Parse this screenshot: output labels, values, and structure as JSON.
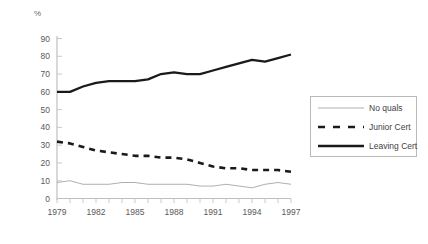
{
  "chart_data": {
    "type": "line",
    "title": "",
    "xlabel": "",
    "ylabel": "%",
    "unit_label": "%",
    "xlim": [
      1979,
      1997
    ],
    "ylim": [
      0,
      90
    ],
    "y_ticks": [
      0,
      10,
      20,
      30,
      40,
      50,
      60,
      70,
      80,
      90
    ],
    "y_tick_labels": [
      "0",
      "10",
      "20",
      "30",
      "40",
      "50",
      "60",
      "70",
      "80",
      "90"
    ],
    "x": [
      1979,
      1980,
      1981,
      1982,
      1983,
      1984,
      1985,
      1986,
      1987,
      1988,
      1989,
      1990,
      1991,
      1992,
      1993,
      1994,
      1995,
      1996,
      1997
    ],
    "x_tick_labels": [
      "1979",
      "1982",
      "1985",
      "1988",
      "1991",
      "1994",
      "1997"
    ],
    "x_ticks": [
      1979,
      1982,
      1985,
      1988,
      1991,
      1994,
      1997
    ],
    "grid": false,
    "legend_position": "right",
    "series": [
      {
        "name": "No quals",
        "style": "thin-solid",
        "color": "#a6a6a6",
        "values": [
          9,
          10,
          8,
          8,
          8,
          9,
          9,
          8,
          8,
          8,
          8,
          7,
          7,
          8,
          7,
          6,
          8,
          9,
          8
        ]
      },
      {
        "name": "Junior Cert",
        "style": "bold-dashed",
        "color": "#1a1a1a",
        "values": [
          32,
          31,
          29,
          27,
          26,
          25,
          24,
          24,
          23,
          23,
          22,
          20,
          18,
          17,
          17,
          16,
          16,
          16,
          15
        ]
      },
      {
        "name": "Leaving Cert",
        "style": "bold-solid",
        "color": "#1a1a1a",
        "values": [
          60,
          60,
          63,
          65,
          66,
          66,
          66,
          67,
          70,
          71,
          70,
          70,
          72,
          74,
          76,
          78,
          77,
          79,
          81
        ]
      }
    ]
  },
  "legend": {
    "items": [
      {
        "label": "No quals",
        "swatch": "thin-solid-line-icon"
      },
      {
        "label": "Junior Cert",
        "swatch": "dashed-line-icon"
      },
      {
        "label": "Leaving Cert",
        "swatch": "solid-line-icon"
      }
    ]
  }
}
